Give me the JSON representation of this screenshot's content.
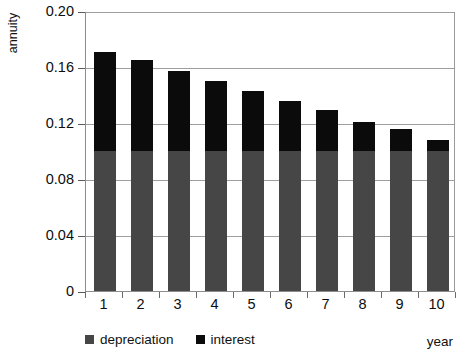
{
  "chart_data": {
    "type": "bar",
    "stacked": true,
    "title": "",
    "xlabel": "year",
    "ylabel": "annuity",
    "categories": [
      "1",
      "2",
      "3",
      "4",
      "5",
      "6",
      "7",
      "8",
      "9",
      "10"
    ],
    "series": [
      {
        "name": "depreciation",
        "color": "#464646",
        "values": [
          0.1,
          0.1,
          0.1,
          0.1,
          0.1,
          0.1,
          0.1,
          0.1,
          0.1,
          0.1
        ]
      },
      {
        "name": "interest",
        "color": "#0b0b0b",
        "values": [
          0.071,
          0.065,
          0.057,
          0.05,
          0.043,
          0.036,
          0.029,
          0.021,
          0.016,
          0.008
        ]
      }
    ],
    "totals": [
      0.171,
      0.165,
      0.157,
      0.15,
      0.143,
      0.136,
      0.129,
      0.121,
      0.116,
      0.108
    ],
    "ylim": [
      0,
      0.2
    ],
    "yticks": [
      0,
      0.04,
      0.08,
      0.12,
      0.16,
      0.2
    ],
    "ytick_labels": [
      "0",
      "0.04",
      "0.08",
      "0.12",
      "0.16",
      "0.20"
    ],
    "grid": true,
    "legend_position": "bottom"
  },
  "legend": {
    "items": [
      {
        "label": "depreciation",
        "color": "#464646"
      },
      {
        "label": "interest",
        "color": "#0b0b0b"
      }
    ]
  },
  "axes": {
    "y_title": "annuity",
    "x_title": "year"
  }
}
